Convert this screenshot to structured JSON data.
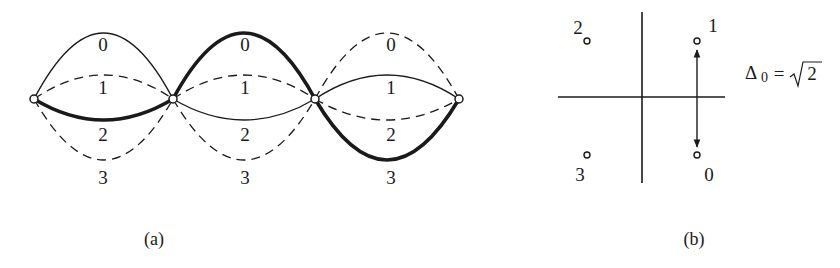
{
  "panel_a": {
    "caption": "(a)",
    "description": "Trellis with 4 nodes and 3 sections; each section has 4 branches labeled 0–3; highlighted path: 1 (section 1), 0 (section 2), 3 (section 3)",
    "sections": [
      {
        "branches": [
          {
            "label": "0",
            "style": "solid",
            "highlight": false
          },
          {
            "label": "1",
            "style": "dashed",
            "highlight": false
          },
          {
            "label": "2",
            "style": "solid",
            "highlight": true
          },
          {
            "label": "3",
            "style": "dashed",
            "highlight": false
          }
        ],
        "labels": [
          "0",
          "1",
          "2",
          "3"
        ]
      },
      {
        "branches": [
          {
            "label": "0",
            "style": "solid",
            "highlight": true
          },
          {
            "label": "1",
            "style": "dashed",
            "highlight": false
          },
          {
            "label": "2",
            "style": "solid",
            "highlight": false
          },
          {
            "label": "3",
            "style": "dashed",
            "highlight": false
          }
        ],
        "labels": [
          "0",
          "1",
          "2",
          "3"
        ]
      },
      {
        "branches": [
          {
            "label": "0",
            "style": "dashed",
            "highlight": false
          },
          {
            "label": "1",
            "style": "solid",
            "highlight": false
          },
          {
            "label": "2",
            "style": "dashed",
            "highlight": false
          },
          {
            "label": "3",
            "style": "solid",
            "highlight": true
          }
        ],
        "labels": [
          "0",
          "1",
          "2",
          "3"
        ]
      }
    ]
  },
  "panel_b": {
    "caption": "(b)",
    "points": [
      {
        "label": "2",
        "quadrant": "top-left"
      },
      {
        "label": "1",
        "quadrant": "top-right"
      },
      {
        "label": "3",
        "quadrant": "bottom-left"
      },
      {
        "label": "0",
        "quadrant": "bottom-right"
      }
    ],
    "distance_label": {
      "delta": "Δ",
      "subscript": "0",
      "equals": "=",
      "sqrt": "√",
      "radicand": "2"
    }
  }
}
